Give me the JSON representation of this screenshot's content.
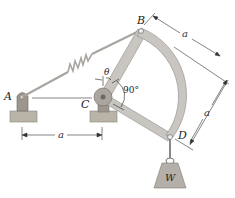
{
  "diagram": {
    "points": {
      "A": "A",
      "B": "B",
      "C": "C",
      "D": "D"
    },
    "dimensions": {
      "AC": "a",
      "BD_top": "a",
      "BD_side": "a"
    },
    "angles": {
      "theta": "θ",
      "right_angle": "90°"
    },
    "weight_label": "W",
    "colors": {
      "member": "#c9c6c2",
      "member_edge": "#8f8b86",
      "ground": "#b9b3a8",
      "ground_edge": "#8a8479",
      "weight": "#b4afa8",
      "spring": "#a9a59f",
      "line": "#222222"
    }
  }
}
